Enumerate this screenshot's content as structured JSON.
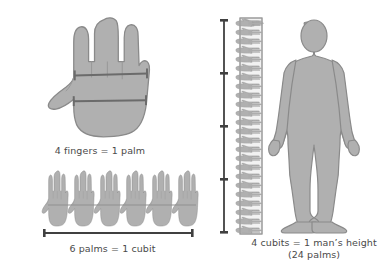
{
  "diagram": {
    "title_implicit": "Ancient units of measure: finger, palm, cubit, man's height",
    "background_color": "#ffffff",
    "shape_fill": "#b0b0b0",
    "shape_stroke": "#8a8a8a",
    "rule_color": "#555555",
    "text_color": "#4a4a4a"
  },
  "panels": {
    "palm": {
      "caption": "4 fingers = 1 palm",
      "figure_name": "open-hand-front-view",
      "finger_count": 4,
      "markers": [
        {
          "name": "finger-width-rule",
          "spans": "across four fingers"
        },
        {
          "name": "palm-width-rule",
          "spans": "across palm base"
        }
      ]
    },
    "cubit": {
      "caption": "6 palms = 1 cubit",
      "figure_name": "row-of-six-hands",
      "hand_count": 6,
      "scale_bar": {
        "name": "cubit-scale-bar",
        "orientation": "horizontal"
      }
    },
    "height": {
      "caption_line1": "4 cubits = 1 man’s height",
      "caption_line2": "(24 palms)",
      "figure_name": "standing-human-silhouette",
      "cubit_divisions": 4,
      "palms_total": 24,
      "scale_bar": {
        "name": "height-scale-bar",
        "orientation": "vertical",
        "tick_count": 3
      },
      "stack": {
        "name": "vertical-hand-stack",
        "hand_count": 24
      }
    }
  }
}
